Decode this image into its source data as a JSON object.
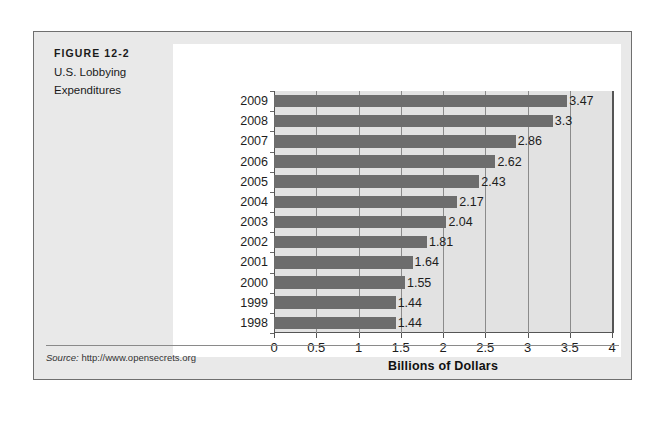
{
  "figure": {
    "number": "FIGURE 12-2",
    "title_line1": "U.S. Lobbying",
    "title_line2": "Expenditures",
    "source_label": "Source:",
    "source_url": "http://www.opensecrets.org"
  },
  "colors": {
    "bar": "#6d6d6d",
    "plot_background": "#e2e2e2",
    "figure_background": "#e9e9e9",
    "panel_background": "#ffffff",
    "axis": "#555555",
    "gridline": "#8b8b8b"
  },
  "chart_data": {
    "type": "bar",
    "orientation": "horizontal",
    "title": "U.S. Lobbying Expenditures",
    "xlabel": "Billions of Dollars",
    "ylabel": "",
    "xlim": [
      0,
      4
    ],
    "xticks": [
      0,
      0.5,
      1,
      1.5,
      2,
      2.5,
      3,
      3.5,
      4
    ],
    "xticklabels": [
      "0",
      "0.5",
      "1",
      "1.5",
      "2",
      "2.5",
      "3",
      "3.5",
      "4"
    ],
    "grid": true,
    "legend": null,
    "categories": [
      "2009",
      "2008",
      "2007",
      "2006",
      "2005",
      "2004",
      "2003",
      "2002",
      "2001",
      "2000",
      "1999",
      "1998"
    ],
    "values": [
      3.47,
      3.3,
      2.86,
      2.62,
      2.43,
      2.17,
      2.04,
      1.81,
      1.64,
      1.55,
      1.44,
      1.44
    ],
    "value_labels": [
      "3.47",
      "3.3",
      "2.86",
      "2.62",
      "2.43",
      "2.17",
      "2.04",
      "1.81",
      "1.64",
      "1.55",
      "1.44",
      "1.44"
    ],
    "source": "http://www.opensecrets.org"
  }
}
